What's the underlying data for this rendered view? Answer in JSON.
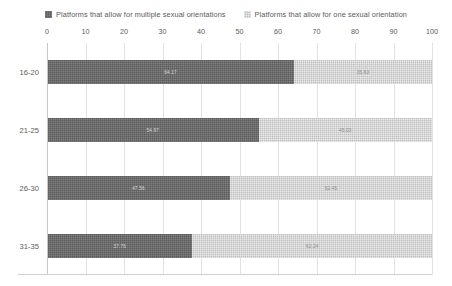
{
  "chart_data": {
    "type": "bar",
    "orientation": "horizontal",
    "stacked": true,
    "stack_total": 100,
    "title": "",
    "xlabel": "",
    "ylabel": "",
    "xlim": [
      0,
      100
    ],
    "grid": true,
    "legend_position": "top",
    "categories": [
      "16-20",
      "21-25",
      "26-30",
      "31-35"
    ],
    "tick_labels": [
      "0",
      "10",
      "20",
      "30",
      "40",
      "50",
      "60",
      "70",
      "80",
      "90",
      "100"
    ],
    "tick_values": [
      0,
      10,
      20,
      30,
      40,
      50,
      60,
      70,
      80,
      90,
      100
    ],
    "series": [
      {
        "name": "Platforms that allow for multiple sexual orientations",
        "color": "#5c5c5c",
        "values": [
          64.17,
          54.97,
          47.56,
          37.76
        ],
        "labels": [
          "64.17",
          "54.97",
          "47.56",
          "37.76"
        ]
      },
      {
        "name": "Platforms that allow for one sexual orientation",
        "color": "#bfbfbf",
        "values": [
          35.83,
          45.03,
          52.45,
          62.24
        ],
        "labels": [
          "35.83",
          "45.03",
          "52.45",
          "62.24"
        ]
      }
    ]
  },
  "legend": {
    "items": [
      {
        "label": "Platforms that allow for multiple sexual orientations",
        "color": "#5c5c5c"
      },
      {
        "label": "Platforms that allow for one sexual orientation",
        "color": "#bfbfbf"
      }
    ]
  }
}
